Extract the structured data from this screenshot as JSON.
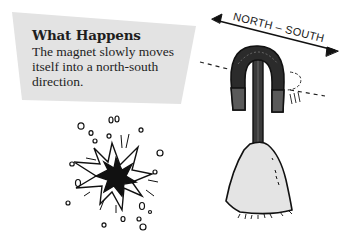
{
  "info_panel": {
    "title": "What Happens",
    "body": "The magnet slowly moves itself into a north-south direction.",
    "background_color": "#e3e3e3"
  },
  "illustration": {
    "direction_label": "NORTH – SOUTH",
    "arrow": "double-headed-arrow",
    "objects": [
      "horseshoe-magnet",
      "rod",
      "clay-base",
      "rotation-indicator",
      "dashed-axis-line",
      "starburst"
    ],
    "colors": {
      "ink": "#111111",
      "magnet_arch": "#2b2b2b",
      "magnet_legs": "#5a5a5a",
      "base_fill": "#e4e4e4"
    }
  }
}
